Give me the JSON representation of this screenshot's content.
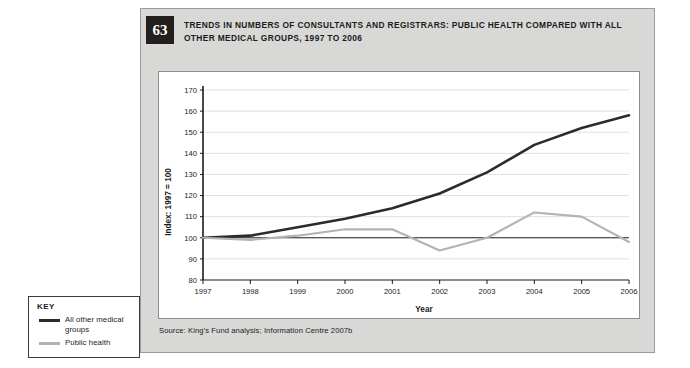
{
  "figure": {
    "number": "63",
    "title": "TRENDS IN NUMBERS OF CONSULTANTS AND REGISTRARS: PUBLIC HEALTH COMPARED WITH ALL OTHER MEDICAL GROUPS, 1997 TO 2006",
    "source": "Source: King's Fund analysis; Information Centre 2007b"
  },
  "key": {
    "title": "KEY",
    "entries": [
      {
        "label": "All other medical groups",
        "color": "#2b2b2b"
      },
      {
        "label": "Public health",
        "color": "#b3b3b3"
      }
    ]
  },
  "chart_data": {
    "type": "line",
    "title": "TRENDS IN NUMBERS OF CONSULTANTS AND REGISTRARS: PUBLIC HEALTH COMPARED WITH ALL OTHER MEDICAL GROUPS, 1997 TO 2006",
    "xlabel": "Year",
    "ylabel": "Index: 1997 = 100",
    "categories": [
      "1997",
      "1998",
      "1999",
      "2000",
      "2001",
      "2002",
      "2003",
      "2004",
      "2005",
      "2006"
    ],
    "x": [
      1997,
      1998,
      1999,
      2000,
      2001,
      2002,
      2003,
      2004,
      2005,
      2006
    ],
    "xlim": [
      1997,
      2006
    ],
    "ylim": [
      80,
      170
    ],
    "yticks": [
      80,
      90,
      100,
      110,
      120,
      130,
      140,
      150,
      160,
      170
    ],
    "xticks": [
      1997,
      1998,
      1999,
      2000,
      2001,
      2002,
      2003,
      2004,
      2005,
      2006
    ],
    "grid": "horizontal",
    "legend_position": "external-left-key-box",
    "series": [
      {
        "name": "All other medical groups",
        "color": "#2b2b2b",
        "values": [
          100,
          101,
          105,
          109,
          114,
          121,
          131,
          144,
          152,
          158
        ]
      },
      {
        "name": "Public health",
        "color": "#b3b3b3",
        "values": [
          100,
          99,
          101,
          104,
          104,
          94,
          100,
          112,
          110,
          98
        ]
      }
    ]
  }
}
